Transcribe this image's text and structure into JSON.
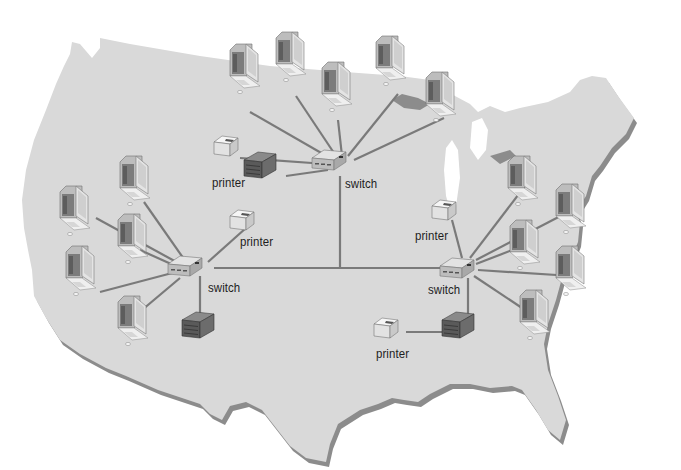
{
  "diagram": {
    "title": "",
    "colors": {
      "background": "#ffffff",
      "map_fill": "#d9d9d9",
      "map_shadow": "#8c8c8c",
      "cable": "#7a7a7a",
      "switch": "#c8c8c8",
      "server": "#5a5a5a",
      "printer": "#e6e6e6",
      "label": "#1e1e1e"
    },
    "labels": {
      "switch_top": "switch",
      "switch_left": "switch",
      "switch_right": "switch",
      "printer_top": "printer",
      "printer_left": "printer",
      "printer_right": "printer",
      "printer_bottom": "printer"
    },
    "clusters": [
      {
        "name": "north",
        "switch_label": "switch",
        "computers": 5,
        "printers": 1,
        "servers": 1
      },
      {
        "name": "west",
        "switch_label": "switch",
        "computers": 5,
        "printers": 1,
        "servers": 1
      },
      {
        "name": "east",
        "switch_label": "switch",
        "computers": 5,
        "printers": 2,
        "servers": 1
      }
    ],
    "backbone": "switch-to-switch links across United States map"
  }
}
